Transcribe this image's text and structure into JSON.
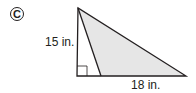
{
  "problem": {
    "letter": "C",
    "height_label": "15 in.",
    "base_label": "18 in."
  },
  "colors": {
    "shade": "#e6e6e6",
    "stroke": "#231f20"
  }
}
